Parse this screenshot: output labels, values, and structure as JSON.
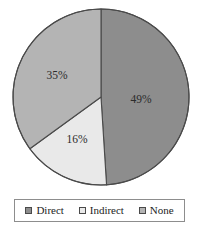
{
  "chart_data": {
    "type": "pie",
    "title": "",
    "categories": [
      "Direct",
      "Indirect",
      "None"
    ],
    "values": [
      49,
      16,
      35
    ],
    "labels": [
      "49%",
      "16%",
      "35%"
    ],
    "unit": "percent",
    "start_angle_deg": 0,
    "direction": "clockwise",
    "colors": [
      "#8d8d8d",
      "#e9e9e9",
      "#b4b4b4"
    ],
    "border_color": "#4a4a4a",
    "legend": {
      "position": "bottom",
      "bordered": true,
      "entries": [
        {
          "label": "Direct",
          "color": "#8d8d8d",
          "swatch": "square-swatch-icon"
        },
        {
          "label": "Indirect",
          "color": "#e9e9e9",
          "swatch": "square-swatch-icon"
        },
        {
          "label": "None",
          "color": "#b4b4b4",
          "swatch": "square-swatch-icon"
        }
      ]
    },
    "geometry": {
      "center_x": 101,
      "center_y": 97,
      "radius": 88
    },
    "slices": [
      {
        "name": "Direct",
        "value": 49,
        "label": "49%",
        "color": "#8d8d8d",
        "start_deg": 0,
        "end_deg": 176.4,
        "label_x": 141,
        "label_y": 100
      },
      {
        "name": "Indirect",
        "value": 16,
        "label": "16%",
        "color": "#e9e9e9",
        "start_deg": 176.4,
        "end_deg": 234.0,
        "label_x": 77,
        "label_y": 140
      },
      {
        "name": "None",
        "value": 35,
        "label": "35%",
        "color": "#b4b4b4",
        "start_deg": 234.0,
        "end_deg": 360,
        "label_x": 57,
        "label_y": 76
      }
    ]
  }
}
